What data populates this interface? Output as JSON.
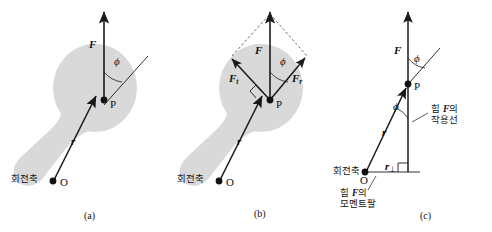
{
  "figure": {
    "colors": {
      "body_fill": "#d9d9d9",
      "stroke": "#1a1a1a",
      "dashed": "#555555",
      "text": "#111111"
    }
  },
  "panels": [
    {
      "id": "a",
      "caption": "(a)",
      "labels": {
        "force": "F",
        "position": "r",
        "angle": "ϕ",
        "point_p": "P",
        "point_o": "O",
        "axis_ko": "회전축"
      }
    },
    {
      "id": "b",
      "caption": "(b)",
      "labels": {
        "force": "F",
        "position": "r",
        "angle": "ϕ",
        "point_p": "P",
        "point_o": "O",
        "axis_ko": "회전축",
        "comp_tangential": "F",
        "comp_tangential_sub": "t",
        "comp_radial": "F",
        "comp_radial_sub": "r"
      }
    },
    {
      "id": "c",
      "caption": "(c)",
      "labels": {
        "force": "F",
        "position": "r",
        "angle_top": "ϕ",
        "angle_bottom": "ϕ",
        "point_p": "P",
        "point_o": "O",
        "axis_ko": "회전축",
        "moment_arm": "r",
        "moment_arm_sub": "⊥",
        "line_of_action_ko_1": "힘 ",
        "line_of_action_ko_f": "F",
        "line_of_action_ko_2": "의",
        "line_of_action_ko_3": "작용선",
        "moment_arm_ko_1": "힘 ",
        "moment_arm_ko_f": "F",
        "moment_arm_ko_2": "의",
        "moment_arm_ko_3": "모멘트팔"
      }
    }
  ]
}
